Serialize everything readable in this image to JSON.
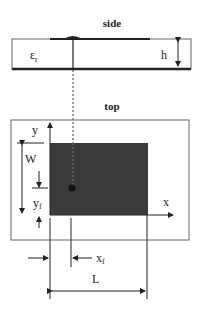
{
  "side_view": {
    "title": "side",
    "permittivity_symbol": "ε",
    "permittivity_subscript": "r",
    "height_label": "h"
  },
  "top_view": {
    "title": "top",
    "x_axis_label": "x",
    "y_axis_label": "y",
    "width_label": "W",
    "length_label": "L",
    "feed_x_label": "x",
    "feed_x_subscript": "f",
    "feed_y_label": "y",
    "feed_y_subscript": "f"
  },
  "colors": {
    "patch_fill": "#3a3a3a",
    "line": "#222222",
    "substrate_outline": "#666666"
  }
}
